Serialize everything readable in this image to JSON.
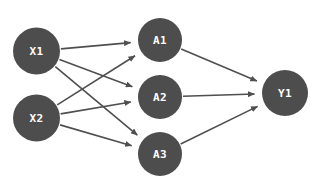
{
  "diagram": {
    "background_color": "#ffffff",
    "node_fill_color": "#4d4d4d",
    "node_label_color": "#ffffff",
    "edge_color": "#4f4f4f",
    "width": 311,
    "height": 186,
    "layers": [
      {
        "name": "input-layer",
        "nodes": [
          {
            "id": "X1",
            "label": "X1",
            "cx": 36.5,
            "cy": 51,
            "r": 23.5
          },
          {
            "id": "X2",
            "label": "X2",
            "cx": 36.5,
            "cy": 118,
            "r": 23.5
          }
        ]
      },
      {
        "name": "hidden-layer",
        "nodes": [
          {
            "id": "A1",
            "label": "A1",
            "cx": 160,
            "cy": 40,
            "r": 22
          },
          {
            "id": "A2",
            "label": "A2",
            "cx": 160,
            "cy": 97,
            "r": 22
          },
          {
            "id": "A3",
            "label": "A3",
            "cx": 160,
            "cy": 154,
            "r": 22
          }
        ]
      },
      {
        "name": "output-layer",
        "nodes": [
          {
            "id": "Y1",
            "label": "Y1",
            "cx": 285,
            "cy": 93,
            "r": 23
          }
        ]
      }
    ],
    "edges": [
      {
        "from": "X1",
        "to": "A1"
      },
      {
        "from": "X1",
        "to": "A2"
      },
      {
        "from": "X1",
        "to": "A3"
      },
      {
        "from": "X2",
        "to": "A1"
      },
      {
        "from": "X2",
        "to": "A2"
      },
      {
        "from": "X2",
        "to": "A3"
      },
      {
        "from": "A1",
        "to": "Y1"
      },
      {
        "from": "A2",
        "to": "Y1"
      },
      {
        "from": "A3",
        "to": "Y1"
      }
    ]
  }
}
